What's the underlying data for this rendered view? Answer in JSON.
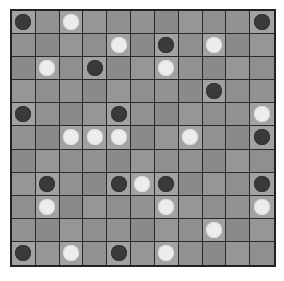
{
  "board": {
    "rows": 11,
    "cols": 11,
    "colors": {
      "black": "#3a3a3a",
      "white": "#ededed",
      "cell": "#8f8f8f",
      "grid": "#2a2a2a"
    },
    "pieces": [
      {
        "row": 0,
        "col": 0,
        "color": "black"
      },
      {
        "row": 0,
        "col": 2,
        "color": "white"
      },
      {
        "row": 0,
        "col": 10,
        "color": "black"
      },
      {
        "row": 1,
        "col": 4,
        "color": "white"
      },
      {
        "row": 1,
        "col": 6,
        "color": "black"
      },
      {
        "row": 1,
        "col": 8,
        "color": "white"
      },
      {
        "row": 2,
        "col": 1,
        "color": "white"
      },
      {
        "row": 2,
        "col": 3,
        "color": "black"
      },
      {
        "row": 2,
        "col": 6,
        "color": "white"
      },
      {
        "row": 3,
        "col": 8,
        "color": "black"
      },
      {
        "row": 4,
        "col": 0,
        "color": "black"
      },
      {
        "row": 4,
        "col": 4,
        "color": "black"
      },
      {
        "row": 4,
        "col": 10,
        "color": "white"
      },
      {
        "row": 5,
        "col": 2,
        "color": "white"
      },
      {
        "row": 5,
        "col": 3,
        "color": "white"
      },
      {
        "row": 5,
        "col": 4,
        "color": "white"
      },
      {
        "row": 5,
        "col": 7,
        "color": "white"
      },
      {
        "row": 5,
        "col": 10,
        "color": "black"
      },
      {
        "row": 7,
        "col": 1,
        "color": "black"
      },
      {
        "row": 7,
        "col": 4,
        "color": "black"
      },
      {
        "row": 7,
        "col": 5,
        "color": "white"
      },
      {
        "row": 7,
        "col": 6,
        "color": "black"
      },
      {
        "row": 7,
        "col": 10,
        "color": "black"
      },
      {
        "row": 8,
        "col": 1,
        "color": "white"
      },
      {
        "row": 8,
        "col": 6,
        "color": "white"
      },
      {
        "row": 8,
        "col": 10,
        "color": "white"
      },
      {
        "row": 9,
        "col": 8,
        "color": "white"
      },
      {
        "row": 10,
        "col": 0,
        "color": "black"
      },
      {
        "row": 10,
        "col": 2,
        "color": "white"
      },
      {
        "row": 10,
        "col": 4,
        "color": "black"
      },
      {
        "row": 10,
        "col": 6,
        "color": "white"
      }
    ]
  }
}
